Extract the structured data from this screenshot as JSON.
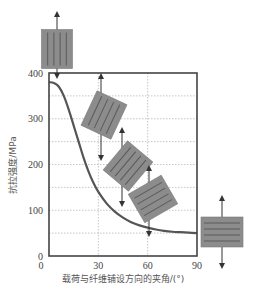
{
  "chart_data": {
    "type": "line",
    "title": "",
    "xlabel": "载荷与纤维铺设方向的夹角/(°)",
    "ylabel": "抗拉强度/MPa",
    "xlim": [
      0,
      90
    ],
    "ylim": [
      0,
      400
    ],
    "xticks": [
      0,
      30,
      60,
      90
    ],
    "yticks": [
      0,
      100,
      200,
      300,
      400
    ],
    "x_tick_labels": [
      "0",
      "30",
      "60",
      "90"
    ],
    "y_tick_labels": [
      "0",
      "100",
      "200",
      "300",
      "400"
    ],
    "grid": true,
    "legend": null,
    "series": [
      {
        "name": "tensile strength",
        "x": [
          0,
          3,
          6,
          9,
          12,
          15,
          18,
          21,
          24,
          27,
          30,
          35,
          40,
          45,
          50,
          55,
          60,
          65,
          70,
          75,
          80,
          85,
          90
        ],
        "values": [
          380,
          378,
          370,
          350,
          320,
          285,
          250,
          215,
          185,
          160,
          140,
          115,
          97,
          84,
          74,
          67,
          62,
          58,
          55,
          53,
          52,
          51,
          50
        ]
      }
    ],
    "annotations": [
      {
        "type": "fiber-sample",
        "angle_deg": 0,
        "position": "above y=400 at x≈5"
      },
      {
        "type": "fiber-sample",
        "angle_deg": 30,
        "position": "x≈30, y≈300"
      },
      {
        "type": "fiber-sample",
        "angle_deg": 45,
        "position": "x≈45, y≈200"
      },
      {
        "type": "fiber-sample",
        "angle_deg": 60,
        "position": "x≈60, y≈130"
      },
      {
        "type": "fiber-sample",
        "angle_deg": 90,
        "position": "right of plot at y≈60"
      }
    ]
  },
  "colors": {
    "curve": "#555555",
    "axis": "#444444",
    "grid": "#b8b8b8",
    "sample_fill": "#8c8c8c",
    "sample_fiber": "#5a5a5a",
    "text": "#444444"
  }
}
